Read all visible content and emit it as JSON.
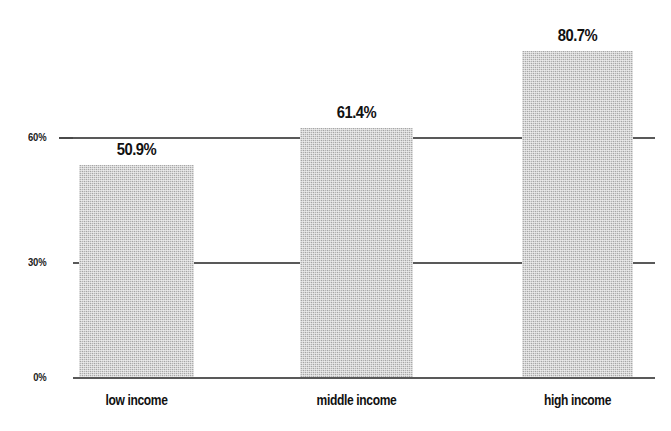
{
  "chart_data": {
    "type": "bar",
    "title": "",
    "subtitle": "",
    "xlabel": "",
    "ylabel": "",
    "categories": [
      "low income",
      "middle income",
      "high income"
    ],
    "values": [
      50.9,
      61.4,
      80.7
    ],
    "value_labels": [
      "50.9%",
      "61.4%",
      "80.7%"
    ],
    "ylim": [
      0,
      90
    ],
    "yticks": [
      0,
      30,
      60
    ],
    "ytick_labels": [
      "0%",
      "30%",
      "60%"
    ],
    "grid": true,
    "grid_axis": "y",
    "legend": false,
    "legend_position": "none",
    "series": [
      {
        "name": "percent",
        "values": [
          50.9,
          61.4,
          80.7
        ]
      }
    ],
    "colors": {
      "bar_fill": "#b4b4b4",
      "grid_line": "#595959",
      "axis_line": "#595959",
      "text": "#111111",
      "background": "#ffffff"
    }
  },
  "axis": {
    "y": {
      "tick_0": "0%",
      "tick_30": "30%",
      "tick_60": "60%"
    }
  },
  "bars": [
    {
      "category": "low income",
      "label": "50.9%",
      "value": 50.9
    },
    {
      "category": "middle income",
      "label": "61.4%",
      "value": 61.4
    },
    {
      "category": "high income",
      "label": "80.7%",
      "value": 80.7
    }
  ]
}
